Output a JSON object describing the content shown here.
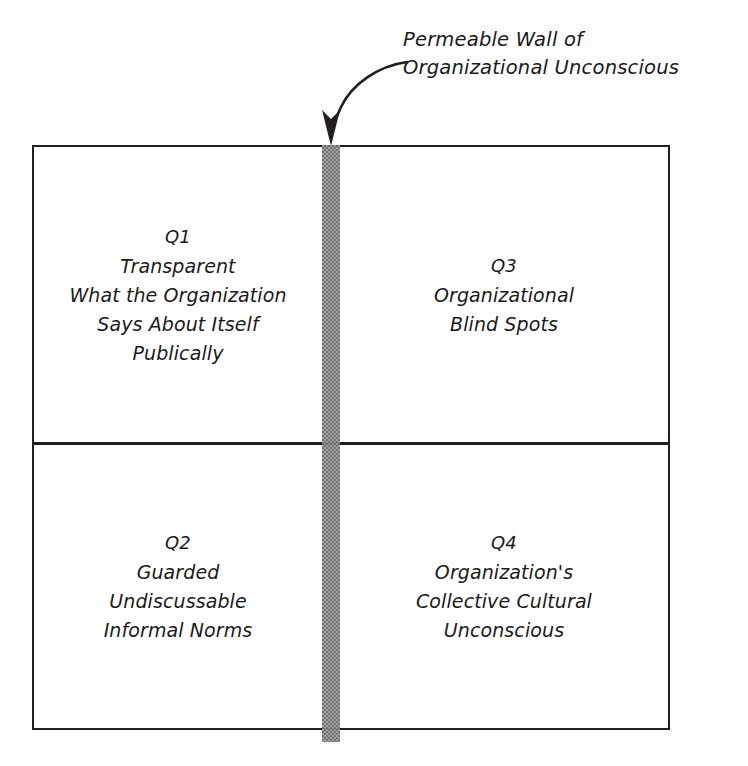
{
  "diagram": {
    "background_color": "#fdfdfd",
    "line_color": "#231f20",
    "wall_color": "#9a9a9a"
  },
  "annotation": {
    "line1": "Permeable Wall of",
    "line2": "Organizational Unconscious",
    "arrow": "curved-arrow-down"
  },
  "quadrants": [
    {
      "id": "Q1",
      "label": "Q1",
      "lines": [
        "Transparent",
        "What the Organization",
        "Says About Itself",
        "Publically"
      ]
    },
    {
      "id": "Q3",
      "label": "Q3",
      "lines": [
        "Organizational",
        "Blind Spots"
      ]
    },
    {
      "id": "Q2",
      "label": "Q2",
      "lines": [
        "Guarded",
        "Undiscussable",
        "Informal Norms"
      ]
    },
    {
      "id": "Q4",
      "label": "Q4",
      "lines": [
        "Organization's",
        "Collective Cultural",
        "Unconscious"
      ]
    }
  ]
}
